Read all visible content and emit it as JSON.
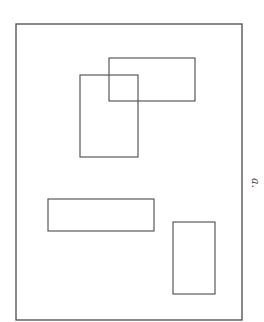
{
  "figure": {
    "label": "a.",
    "line_color": "#4a4a4a",
    "background": "#ffffff",
    "frame": {
      "x": 16,
      "y": 24,
      "width": 226,
      "height": 296
    },
    "rectangles": [
      {
        "name": "top-wide-rectangle",
        "x": 109,
        "y": 58,
        "width": 86,
        "height": 43
      },
      {
        "name": "top-tall-rectangle",
        "x": 80,
        "y": 75,
        "width": 58,
        "height": 82
      },
      {
        "name": "bottom-wide-rectangle",
        "x": 48,
        "y": 199,
        "width": 106,
        "height": 32
      },
      {
        "name": "bottom-tall-rectangle",
        "x": 173,
        "y": 222,
        "width": 42,
        "height": 72
      }
    ]
  }
}
